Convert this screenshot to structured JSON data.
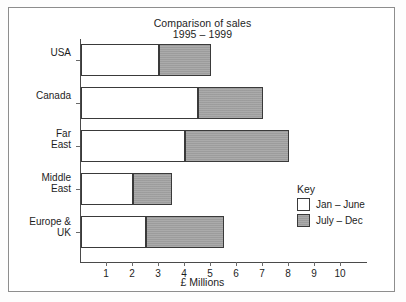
{
  "chart_data": {
    "type": "bar",
    "orientation": "horizontal",
    "stacked": true,
    "title": "Comparison of sales",
    "subtitle": "1995 – 1999",
    "xlabel": "£ Millions",
    "ylabel": "",
    "xlim": [
      0,
      11
    ],
    "xticks": [
      1,
      2,
      3,
      4,
      5,
      6,
      7,
      8,
      9,
      10
    ],
    "xtick_labels": [
      "1",
      "2",
      "3",
      "4",
      "5",
      "6",
      "7",
      "8",
      "9",
      "10"
    ],
    "grid": false,
    "legend_title": "Key",
    "legend_position": "right-inside",
    "categories": [
      "USA",
      "Canada",
      "Far East",
      "Middle East",
      "Europe & UK"
    ],
    "category_lines": [
      [
        "USA"
      ],
      [
        "Canada"
      ],
      [
        "Far",
        "East"
      ],
      [
        "Middle",
        "East"
      ],
      [
        "Europe &",
        "UK"
      ]
    ],
    "series": [
      {
        "name": "Jan – June",
        "color": "#ffffff",
        "values": [
          3.0,
          4.5,
          4.0,
          2.0,
          2.5
        ]
      },
      {
        "name": "July – Dec",
        "color": "#a2a2a2",
        "values": [
          2.0,
          2.5,
          4.0,
          1.5,
          3.0
        ]
      }
    ],
    "cumulative_ends": [
      [
        3.0,
        5.0
      ],
      [
        4.5,
        7.0
      ],
      [
        4.0,
        8.0
      ],
      [
        2.0,
        3.5
      ],
      [
        2.5,
        5.5
      ]
    ],
    "totals": [
      5.0,
      7.0,
      8.0,
      3.5,
      5.5
    ]
  },
  "legend": {
    "title": "Key",
    "items": [
      {
        "label": "Jan – June",
        "swatch": "white"
      },
      {
        "label": "July – Dec",
        "swatch": "grey"
      }
    ]
  },
  "colors": {
    "series_1": "#ffffff",
    "series_2": "#a2a2a2",
    "outline": "#3a3a3a",
    "axis": "#4a4a4a",
    "frame": "#8d8d8d",
    "text": "#1d1d1d",
    "background": "#ffffff"
  }
}
